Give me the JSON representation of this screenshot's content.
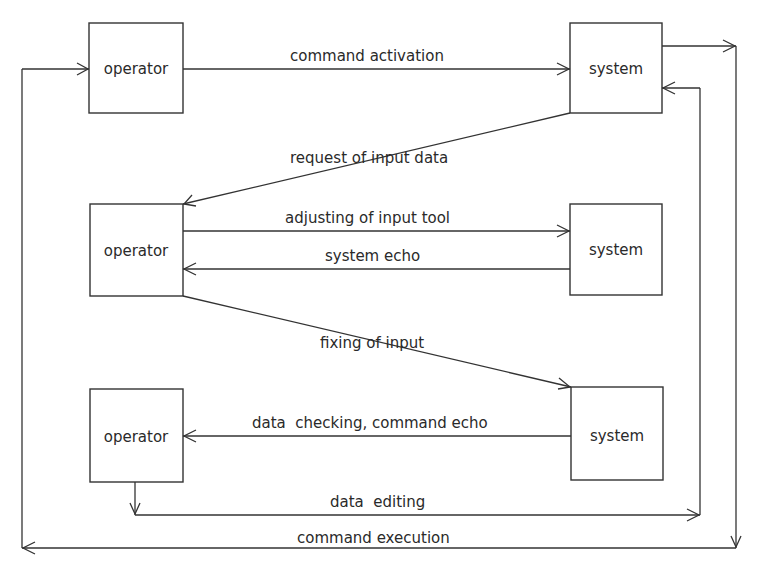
{
  "diagram": {
    "type": "flow",
    "nodes": [
      {
        "id": "operator-1",
        "label": "operator"
      },
      {
        "id": "system-1",
        "label": "system"
      },
      {
        "id": "operator-2",
        "label": "operator"
      },
      {
        "id": "system-2",
        "label": "system"
      },
      {
        "id": "operator-3",
        "label": "operator"
      },
      {
        "id": "system-3",
        "label": "system"
      }
    ],
    "edges": [
      {
        "id": "command-activation",
        "from": "operator-1",
        "to": "system-1",
        "label": "command activation"
      },
      {
        "id": "request-of-input-data",
        "from": "system-1",
        "to": "operator-2",
        "label": "request of input data"
      },
      {
        "id": "adjusting-of-input-tool",
        "from": "operator-2",
        "to": "system-2",
        "label": "adjusting of input tool"
      },
      {
        "id": "system-echo",
        "from": "system-2",
        "to": "operator-2",
        "label": "system echo"
      },
      {
        "id": "fixing-of-input",
        "from": "operator-2",
        "to": "system-3",
        "label": "fixing of input"
      },
      {
        "id": "data-checking-command-echo",
        "from": "system-3",
        "to": "operator-3",
        "label": "data  checking, command echo"
      },
      {
        "id": "data-editing",
        "from": "operator-3",
        "to": "system-1",
        "label": "data  editing"
      },
      {
        "id": "command-execution",
        "from": "system-1",
        "to": "operator-1",
        "label": "command execution"
      }
    ]
  }
}
